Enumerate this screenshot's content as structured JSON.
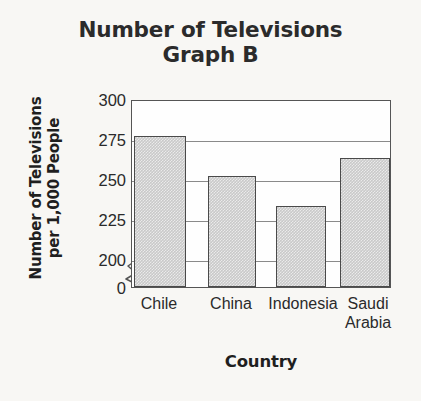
{
  "chart_data": {
    "type": "bar",
    "title": "Number of Televisions",
    "subtitle": "Graph B",
    "title_lines": [
      "Number of Televisions",
      "Graph B"
    ],
    "xlabel": "Country",
    "ylabel": "Number of Televisions per 1,000 People",
    "ylabel_lines": [
      "Number of Televisions",
      "per 1,000 People"
    ],
    "categories": [
      "Chile",
      "China",
      "Indonesia",
      "Saudi Arabia"
    ],
    "category_lines": [
      [
        "Chile"
      ],
      [
        "China"
      ],
      [
        "Indonesia"
      ],
      [
        "Saudi",
        "Arabia"
      ]
    ],
    "values": [
      277,
      252,
      233,
      263
    ],
    "ytick_labels": [
      "300",
      "275",
      "250",
      "225",
      "200",
      "0"
    ],
    "ytick_values": [
      300,
      275,
      250,
      225,
      200,
      0
    ],
    "ylim": [
      200,
      300
    ],
    "axis_break": true,
    "axis_break_note": "y-axis broken between 0 and 200",
    "grid": true,
    "grid_orientation": "horizontal",
    "legend": "none",
    "bar_fill_color": "#c9c9c9",
    "bar_edge_color": "#4a4a4a",
    "grid_color": "#8a8a8a",
    "frame_color": "#555555",
    "background_color": "#f8f7f4",
    "text_color": "#2a2a2a"
  }
}
